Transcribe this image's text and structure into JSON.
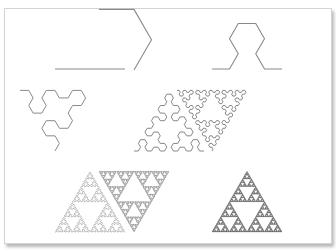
{
  "figure": {
    "frame": {
      "border_color": "#d4d4d4",
      "background": "#ffffff"
    },
    "panels": [
      {
        "order": 0,
        "x": 55,
        "base_y": 69,
        "width": 70,
        "stroke": "#8a8a8a",
        "stroke_width": 1.1
      },
      {
        "order": 1,
        "x": 134,
        "base_y": 70,
        "width": 70,
        "stroke": "#8a8a8a",
        "stroke_width": 1.1
      },
      {
        "order": 2,
        "x": 212,
        "base_y": 69,
        "width": 70,
        "stroke": "#8a8a8a",
        "stroke_width": 1.1
      },
      {
        "order": 3,
        "x": 55,
        "base_y": 151,
        "width": 70,
        "stroke": "#8a8a8a",
        "stroke_width": 1.0
      },
      {
        "order": 4,
        "x": 134,
        "base_y": 151,
        "width": 70,
        "stroke": "#7a7a7a",
        "stroke_width": 0.9
      },
      {
        "order": 5,
        "x": 212,
        "base_y": 151,
        "width": 70,
        "stroke": "#6a6a6a",
        "stroke_width": 0.8
      },
      {
        "order": 6,
        "x": 55,
        "base_y": 232,
        "width": 70,
        "stroke": "#888888",
        "stroke_width": 0.55
      },
      {
        "order": 7,
        "x": 134,
        "base_y": 232,
        "width": 70,
        "stroke": "#555555",
        "stroke_width": 0.5
      },
      {
        "order": 8,
        "x": 212,
        "base_y": 232,
        "width": 70,
        "stroke": "#222222",
        "stroke_width": 0.45
      }
    ]
  }
}
